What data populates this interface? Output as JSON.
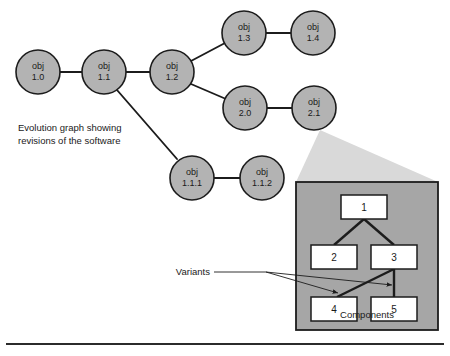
{
  "figure": {
    "caption": {
      "line1": "Evolution graph showing",
      "line2": "revisions of the software"
    },
    "colors": {
      "node_fill": "#b3b3b3",
      "node_stroke": "#1c1c1c",
      "panel_fill": "#a6a6a6",
      "cone_fill": "#d9d9d9",
      "box_fill": "#ffffff",
      "line": "#1c1c1c",
      "page_background": "#ffffff"
    }
  },
  "evolution_graph": {
    "nodes": [
      {
        "id": "obj-1-0",
        "line1": "obj",
        "line2": "1.0",
        "cx": 38,
        "cy": 72,
        "r": 22
      },
      {
        "id": "obj-1-1",
        "line1": "obj",
        "line2": "1.1",
        "cx": 104,
        "cy": 72,
        "r": 22
      },
      {
        "id": "obj-1-2",
        "line1": "obj",
        "line2": "1.2",
        "cx": 172,
        "cy": 72,
        "r": 22
      },
      {
        "id": "obj-1-3",
        "line1": "obj",
        "line2": "1.3",
        "cx": 244,
        "cy": 33,
        "r": 22
      },
      {
        "id": "obj-1-4",
        "line1": "obj",
        "line2": "1.4",
        "cx": 313,
        "cy": 33,
        "r": 22
      },
      {
        "id": "obj-2-0",
        "line1": "obj",
        "line2": "2.0",
        "cx": 245,
        "cy": 108,
        "r": 22
      },
      {
        "id": "obj-2-1",
        "line1": "obj",
        "line2": "2.1",
        "cx": 314,
        "cy": 108,
        "r": 22
      },
      {
        "id": "obj-1-1-1",
        "line1": "obj",
        "line2": "1.1.1",
        "cx": 192,
        "cy": 178,
        "r": 22
      },
      {
        "id": "obj-1-1-2",
        "line1": "obj",
        "line2": "1.1.2",
        "cx": 262,
        "cy": 178,
        "r": 22
      }
    ],
    "edges": [
      {
        "id": "edge-1-0-to-1-1",
        "x1": 60,
        "y1": 72,
        "x2": 82,
        "y2": 72
      },
      {
        "id": "edge-1-1-to-1-2",
        "x1": 126,
        "y1": 72,
        "x2": 150,
        "y2": 72
      },
      {
        "id": "edge-1-2-to-1-3",
        "x1": 191,
        "y1": 61,
        "x2": 225,
        "y2": 43
      },
      {
        "id": "edge-1-3-to-1-4",
        "x1": 266,
        "y1": 33,
        "x2": 291,
        "y2": 33
      },
      {
        "id": "edge-1-2-to-2-0",
        "x1": 191,
        "y1": 84,
        "x2": 226,
        "y2": 99
      },
      {
        "id": "edge-2-0-to-2-1",
        "x1": 267,
        "y1": 108,
        "x2": 292,
        "y2": 108
      },
      {
        "id": "edge-1-1-to-1-1-1",
        "x1": 117,
        "y1": 90,
        "x2": 177,
        "y2": 159
      },
      {
        "id": "edge-1-1-1-to-1-1-2",
        "x1": 214,
        "y1": 178,
        "x2": 240,
        "y2": 178
      }
    ]
  },
  "detail_panel": {
    "cone": {
      "apex_x": 320,
      "apex_y": 130,
      "left_x": 296,
      "right_x": 438,
      "base_y": 182
    },
    "rect": {
      "x": 296,
      "y": 182,
      "width": 142,
      "height": 148
    },
    "caption": "Components",
    "variants_label": "Variants",
    "boxes": [
      {
        "id": "component-1",
        "label": "1",
        "x": 341,
        "y": 195,
        "width": 46,
        "height": 24
      },
      {
        "id": "component-2",
        "label": "2",
        "x": 311,
        "y": 245,
        "width": 46,
        "height": 24
      },
      {
        "id": "component-3",
        "label": "3",
        "x": 371,
        "y": 245,
        "width": 46,
        "height": 24
      },
      {
        "id": "component-4",
        "label": "4",
        "x": 311,
        "y": 297,
        "width": 46,
        "height": 24
      },
      {
        "id": "component-5",
        "label": "5",
        "x": 371,
        "y": 297,
        "width": 46,
        "height": 24
      }
    ],
    "edges": [
      {
        "id": "comp-edge-1-to-2",
        "x1": 364,
        "y1": 219,
        "x2": 334,
        "y2": 245
      },
      {
        "id": "comp-edge-1-to-3",
        "x1": 364,
        "y1": 219,
        "x2": 394,
        "y2": 245
      },
      {
        "id": "comp-edge-3-to-4",
        "x1": 394,
        "y1": 269,
        "x2": 337,
        "y2": 297
      },
      {
        "id": "comp-edge-3-to-5",
        "x1": 394,
        "y1": 269,
        "x2": 394,
        "y2": 297
      }
    ],
    "variant_arrows": [
      {
        "id": "variant-arrow-to-4",
        "x1": 266,
        "y1": 272,
        "x2": 338,
        "y2": 293
      },
      {
        "id": "variant-arrow-to-5",
        "x1": 266,
        "y1": 272,
        "x2": 392,
        "y2": 285
      }
    ],
    "variants_label_pos": {
      "x": 262,
      "y": 275
    }
  },
  "footer_rule": {
    "x1": 6,
    "y1": 344,
    "x2": 444,
    "y2": 344
  }
}
